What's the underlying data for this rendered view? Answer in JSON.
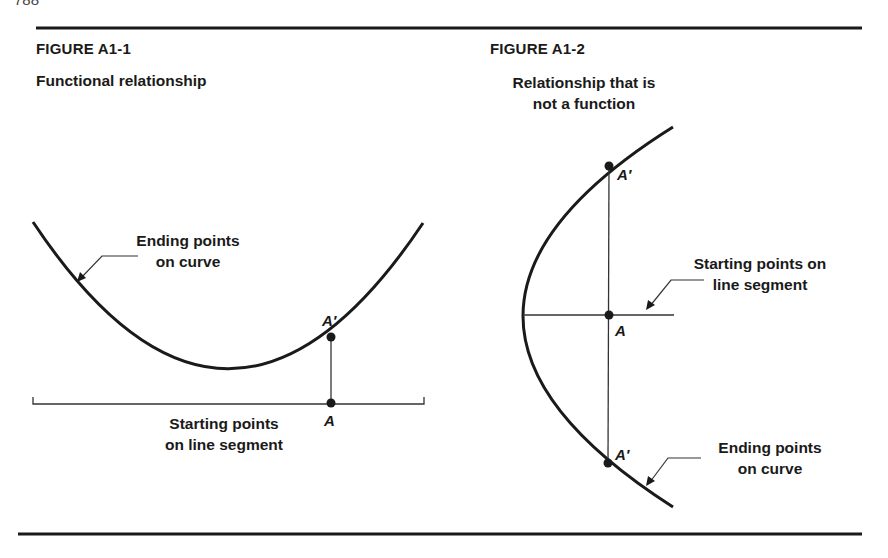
{
  "page": {
    "page_number": "788"
  },
  "figures": [
    {
      "id": "A1-1",
      "title": "FIGURE A1-1",
      "caption": "Functional relationship",
      "curve_label_line1": "Ending points",
      "curve_label_line2": "on curve",
      "segment_label_line1": "Starting points",
      "segment_label_line2": "on line segment",
      "point_start": "A",
      "point_end": "A′"
    },
    {
      "id": "A1-2",
      "title": "FIGURE A1-2",
      "caption_line1": "Relationship that is",
      "caption_line2": "not a function",
      "segment_label_line1": "Starting points on",
      "segment_label_line2": "line segment",
      "curve_label_line1": "Ending points",
      "curve_label_line2": "on curve",
      "point_start": "A",
      "point_end_top": "A′",
      "point_end_bottom": "A′"
    }
  ],
  "colors": {
    "ink": "#1a1a1a",
    "background": "#ffffff"
  }
}
